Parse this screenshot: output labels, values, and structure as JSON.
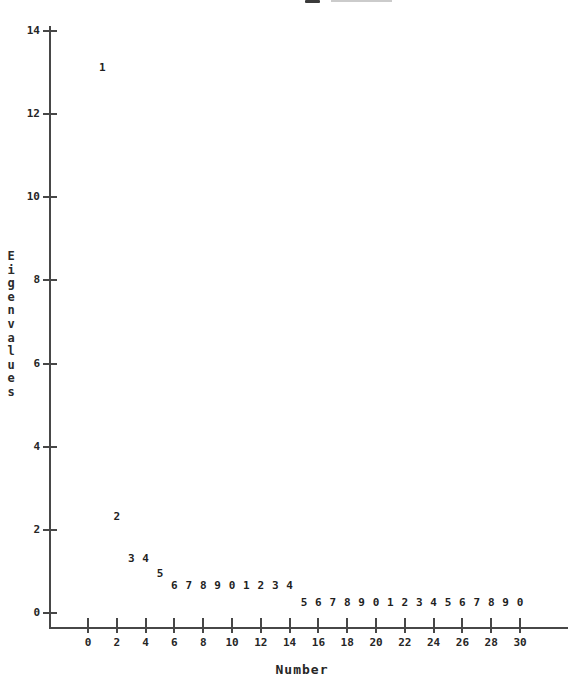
{
  "chart_data": {
    "type": "scatter",
    "title": "",
    "xlabel": "Number",
    "ylabel": "Eigenvalues",
    "x_ticks": [
      0,
      2,
      4,
      6,
      8,
      10,
      12,
      14,
      16,
      18,
      20,
      22,
      24,
      26,
      28,
      30
    ],
    "y_ticks": [
      0,
      2,
      4,
      6,
      8,
      10,
      12,
      14
    ],
    "xlim": [
      -3.3,
      33.3
    ],
    "ylim": [
      -0.36,
      14.1
    ],
    "grid": false,
    "legend": false,
    "marker": "digit-label (last digit of component number)",
    "points": [
      {
        "n": 1,
        "eigenvalue": 13.1,
        "label": "1"
      },
      {
        "n": 2,
        "eigenvalue": 2.3,
        "label": "2"
      },
      {
        "n": 3,
        "eigenvalue": 1.3,
        "label": "3"
      },
      {
        "n": 4,
        "eigenvalue": 1.3,
        "label": "4"
      },
      {
        "n": 5,
        "eigenvalue": 0.95,
        "label": "5"
      },
      {
        "n": 6,
        "eigenvalue": 0.65,
        "label": "6"
      },
      {
        "n": 7,
        "eigenvalue": 0.65,
        "label": "7"
      },
      {
        "n": 8,
        "eigenvalue": 0.65,
        "label": "8"
      },
      {
        "n": 9,
        "eigenvalue": 0.65,
        "label": "9"
      },
      {
        "n": 10,
        "eigenvalue": 0.65,
        "label": "0"
      },
      {
        "n": 11,
        "eigenvalue": 0.65,
        "label": "1"
      },
      {
        "n": 12,
        "eigenvalue": 0.65,
        "label": "2"
      },
      {
        "n": 13,
        "eigenvalue": 0.65,
        "label": "3"
      },
      {
        "n": 14,
        "eigenvalue": 0.65,
        "label": "4"
      },
      {
        "n": 15,
        "eigenvalue": 0.25,
        "label": "5"
      },
      {
        "n": 16,
        "eigenvalue": 0.25,
        "label": "6"
      },
      {
        "n": 17,
        "eigenvalue": 0.25,
        "label": "7"
      },
      {
        "n": 18,
        "eigenvalue": 0.25,
        "label": "8"
      },
      {
        "n": 19,
        "eigenvalue": 0.25,
        "label": "9"
      },
      {
        "n": 20,
        "eigenvalue": 0.25,
        "label": "0"
      },
      {
        "n": 21,
        "eigenvalue": 0.25,
        "label": "1"
      },
      {
        "n": 22,
        "eigenvalue": 0.25,
        "label": "2"
      },
      {
        "n": 23,
        "eigenvalue": 0.25,
        "label": "3"
      },
      {
        "n": 24,
        "eigenvalue": 0.25,
        "label": "4"
      },
      {
        "n": 25,
        "eigenvalue": 0.25,
        "label": "5"
      },
      {
        "n": 26,
        "eigenvalue": 0.25,
        "label": "6"
      },
      {
        "n": 27,
        "eigenvalue": 0.25,
        "label": "7"
      },
      {
        "n": 28,
        "eigenvalue": 0.25,
        "label": "8"
      },
      {
        "n": 29,
        "eigenvalue": 0.25,
        "label": "9"
      },
      {
        "n": 30,
        "eigenvalue": 0.25,
        "label": "0"
      }
    ]
  },
  "colors": {
    "background": "#ffffff",
    "axis": "#474747",
    "ink": "#262626",
    "scan_artifact_light": "#cbcbcb"
  }
}
